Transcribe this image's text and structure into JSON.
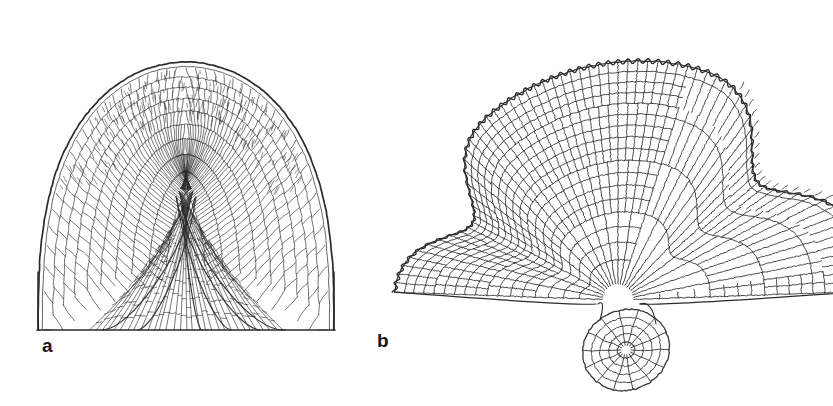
{
  "figure": {
    "kind": "scientific-line-drawing",
    "background_color": "#ffffff",
    "ink_color": "#2b2b2b",
    "width": 833,
    "height": 406,
    "panels": [
      {
        "id": "a",
        "label": "a",
        "label_x": 42,
        "label_y": 336,
        "description": "Longitudinal section of a dome-shaped apex showing an outer epidermal membrane, a dense palisade-like cortical layer of obliquely stacked cells, and an inner core of elongated vertical cell files.",
        "outline": {
          "apex_cx": 186,
          "apex_top_y": 62,
          "base_y": 330,
          "left_x": 38,
          "right_x": 334,
          "shoulder_y": 170
        },
        "layers": [
          {
            "name": "outer-membrane",
            "stroke_width": 1.6
          },
          {
            "name": "cortical-palisade-cells",
            "rows": 26,
            "columns": 52,
            "stroke_width": 0.85
          },
          {
            "name": "inner-cell-files",
            "files": 34,
            "stroke_width": 0.8
          },
          {
            "name": "vascular-strands",
            "count": 6,
            "stroke_width": 1.0
          }
        ]
      },
      {
        "id": "b",
        "label": "b",
        "label_x": 377,
        "label_y": 331,
        "description": "Fan-shaped cellular thallus with radiating cell files arranged in concentric arcs; the right sector shows elongated cells with few cross walls, and a bulbous rhizoidal outgrowth sits at the lower centre.",
        "fan": {
          "origin_x": 618,
          "origin_y": 300,
          "inner_radius": 16,
          "outer_radius": 238,
          "start_angle_deg": 182,
          "end_angle_deg": 358,
          "radial_files": 74,
          "concentric_rings": 17,
          "stroke_width": 0.95
        },
        "elongated_sector": {
          "start_angle_deg": 288,
          "end_angle_deg": 352,
          "cross_walls": 4
        },
        "rhizoid": {
          "cx": 626,
          "cy": 350,
          "rx": 44,
          "ry": 40,
          "rings": 5,
          "spokes": 14
        },
        "notches": [
          {
            "name": "left-sinus",
            "angle_deg": 208,
            "depth": 46
          },
          {
            "name": "right-sinus",
            "angle_deg": 322,
            "depth": 52
          }
        ]
      }
    ]
  }
}
